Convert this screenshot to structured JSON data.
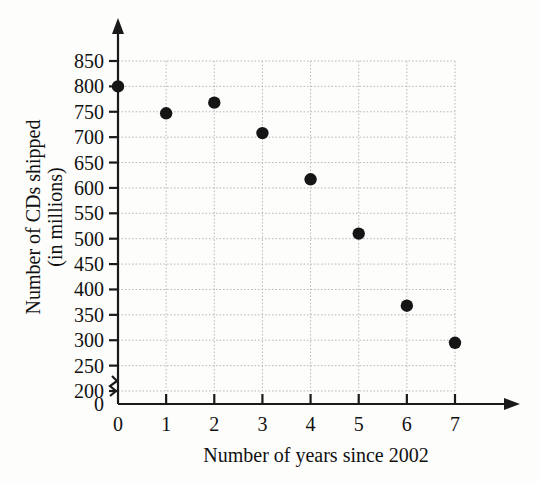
{
  "chart_data": {
    "type": "scatter",
    "title": "",
    "xlabel": "Number of years since 2002",
    "ylabel": "Number of CDs shipped (in millions)",
    "ylabel_line1": "Number of CDs shipped",
    "ylabel_line2": "(in millions)",
    "x": [
      0,
      1,
      2,
      3,
      4,
      5,
      6,
      7
    ],
    "values": [
      800,
      747,
      768,
      708,
      617,
      510,
      368,
      295
    ],
    "points": [
      {
        "x": 0,
        "y": 800
      },
      {
        "x": 1,
        "y": 747
      },
      {
        "x": 2,
        "y": 768
      },
      {
        "x": 3,
        "y": 708
      },
      {
        "x": 4,
        "y": 617
      },
      {
        "x": 5,
        "y": 510
      },
      {
        "x": 6,
        "y": 368
      },
      {
        "x": 7,
        "y": 295
      }
    ],
    "xticks": [
      "0",
      "1",
      "2",
      "3",
      "4",
      "5",
      "6",
      "7"
    ],
    "xtick_values": [
      0,
      1,
      2,
      3,
      4,
      5,
      6,
      7
    ],
    "yticks": [
      "0",
      "200",
      "250",
      "300",
      "350",
      "400",
      "450",
      "500",
      "550",
      "600",
      "650",
      "700",
      "750",
      "800",
      "850"
    ],
    "ytick_values": [
      0,
      200,
      250,
      300,
      350,
      400,
      450,
      500,
      550,
      600,
      650,
      700,
      750,
      800,
      850
    ],
    "ylim": [
      200,
      850
    ],
    "xlim": [
      0,
      7
    ],
    "axis_break": true,
    "axis_break_label": "0",
    "grid": true,
    "legend": null,
    "marker_color": "#151515",
    "axis_color": "#1a1a1a",
    "grid_color": "#b9b9b9",
    "background_color": "#fdfdfb"
  }
}
